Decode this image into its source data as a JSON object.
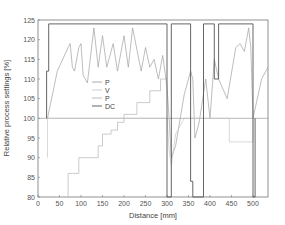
{
  "chart_data": {
    "type": "line",
    "title": "",
    "xlabel": "Distance [mm]",
    "ylabel": "Relative process settings [%]",
    "xlim": [
      0,
      535
    ],
    "ylim": [
      80,
      125
    ],
    "xticks": [
      0,
      50,
      100,
      150,
      200,
      250,
      300,
      350,
      400,
      450,
      500
    ],
    "yticks": [
      80,
      85,
      90,
      95,
      100,
      105,
      110,
      115,
      120,
      125
    ],
    "grid": false,
    "legend": {
      "position": "center-left",
      "entries": [
        "P",
        "V",
        "P",
        "DC"
      ]
    },
    "reference_line": {
      "y": 100
    },
    "series": [
      {
        "name": "P",
        "color": "#a0a0a0",
        "x": [
          22,
          45,
          70,
          75,
          80,
          85,
          95,
          100,
          105,
          115,
          130,
          140,
          150,
          160,
          175,
          185,
          200,
          210,
          220,
          240,
          250,
          260,
          270,
          280,
          290,
          300,
          305,
          310,
          320,
          340,
          355,
          360,
          365,
          375,
          390,
          400,
          410,
          420,
          440,
          460,
          470,
          480,
          490,
          495,
          500,
          520,
          535
        ],
        "values": [
          100,
          112,
          118,
          119,
          113,
          112,
          118,
          119,
          111,
          109,
          123,
          113,
          121,
          113,
          119,
          112,
          121,
          113,
          123,
          112,
          118,
          113,
          115,
          110,
          116,
          108,
          100,
          90,
          93,
          106,
          112,
          110,
          95,
          99,
          110,
          100,
          115,
          110,
          105,
          118,
          119,
          117,
          123,
          118,
          100,
          110,
          113
        ]
      },
      {
        "name": "V",
        "color": "#c8c8c8",
        "x": [
          22,
          22,
          300,
          300,
          305,
          310,
          320,
          340,
          360,
          360,
          390,
          390,
          445,
          445,
          500,
          500
        ],
        "values": [
          90,
          100,
          100,
          100,
          92,
          88,
          96,
          100,
          100,
          100,
          100,
          100,
          100,
          94,
          94,
          100
        ]
      },
      {
        "name": "P",
        "color": "#b4b4b4",
        "x": [
          70,
          70,
          80,
          80,
          95,
          95,
          140,
          140,
          150,
          150,
          170,
          170,
          185,
          185,
          200,
          200,
          230,
          230,
          260,
          260,
          285,
          285,
          300
        ],
        "values": [
          80,
          86,
          86,
          86,
          86,
          90,
          90,
          93,
          93,
          96,
          96,
          97,
          97,
          99,
          99,
          101,
          101,
          104,
          104,
          107,
          107,
          110,
          110
        ]
      },
      {
        "name": "DC",
        "color": "#555555",
        "x": [
          20,
          20,
          25,
          25,
          300,
          300,
          310,
          310,
          355,
          355,
          360,
          360,
          385,
          385,
          410,
          410,
          420,
          420,
          500,
          500,
          505,
          505
        ],
        "values": [
          100,
          112,
          112,
          124,
          124,
          80,
          80,
          124,
          124,
          84,
          84,
          80,
          80,
          124,
          124,
          110,
          110,
          124,
          124,
          80,
          80,
          100
        ]
      }
    ]
  }
}
